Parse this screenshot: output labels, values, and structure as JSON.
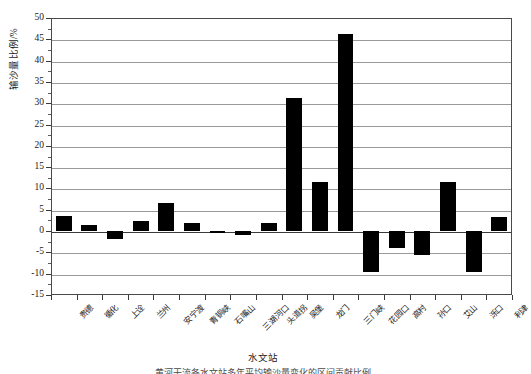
{
  "chart_data": {
    "type": "bar",
    "title": "",
    "xlabel": "水文站",
    "ylabel": "输沙量比例/%",
    "ylim": [
      -15,
      50
    ],
    "ytick_step": 5,
    "yticks": [
      -15,
      -10,
      -5,
      0,
      5,
      10,
      15,
      20,
      25,
      30,
      35,
      40,
      45,
      50
    ],
    "ytick_labels": [
      "-15",
      "-10",
      "-5",
      "0",
      "5",
      "10",
      "15",
      "20",
      "25",
      "30",
      "35",
      "40",
      "45",
      "50"
    ],
    "grid": true,
    "grid_axis": "y",
    "legend": false,
    "bar_color": "#000000",
    "categories": [
      "贵德",
      "循化",
      "上诠",
      "兰州",
      "安宁渡",
      "青铜峡",
      "石嘴山",
      "三湖河口",
      "头道拐",
      "吴堡",
      "龙门",
      "三门峡",
      "花园口",
      "高村",
      "孙口",
      "艾山",
      "泺口",
      "利津"
    ],
    "values": [
      3.6,
      1.5,
      -1.8,
      2.4,
      6.6,
      2.0,
      -0.5,
      -1.0,
      2.0,
      31.2,
      11.5,
      46.2,
      -9.6,
      -4.0,
      -5.5,
      11.5,
      -9.6,
      3.3
    ],
    "series": [
      {
        "name": "输沙量比例",
        "values": [
          3.6,
          1.5,
          -1.8,
          2.4,
          6.6,
          2.0,
          -0.5,
          -1.0,
          2.0,
          31.2,
          11.5,
          46.2,
          -9.6,
          -4.0,
          -5.5,
          11.5,
          -9.6,
          3.3
        ]
      }
    ]
  },
  "caption": {
    "text": "黄河干流各水文站多年平均输沙量变化的区间贡献比例"
  }
}
